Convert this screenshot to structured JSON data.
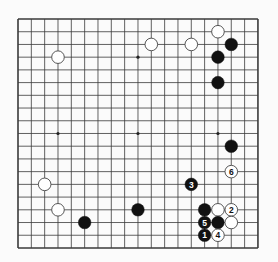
{
  "board": {
    "size": 19,
    "origin_x": 18,
    "origin_y": 19,
    "step_x": 13.33,
    "step_y": 12.72,
    "stone_radius": 6.3,
    "colors": {
      "background": "#fbfbfb",
      "line": "#3a3a3a",
      "black_stone": "#111111",
      "white_stone": "#ffffff",
      "white_outline": "#444444",
      "hoshi": "#222222"
    },
    "hoshi": [
      [
        3,
        3
      ],
      [
        9,
        3
      ],
      [
        15,
        3
      ],
      [
        3,
        9
      ],
      [
        9,
        9
      ],
      [
        15,
        9
      ],
      [
        3,
        15
      ],
      [
        9,
        15
      ],
      [
        15,
        15
      ]
    ],
    "stones": [
      {
        "color": "white",
        "col": 3,
        "row": 3,
        "label": ""
      },
      {
        "color": "white",
        "col": 10,
        "row": 2,
        "label": ""
      },
      {
        "color": "white",
        "col": 13,
        "row": 2,
        "label": ""
      },
      {
        "color": "white",
        "col": 15,
        "row": 1,
        "label": ""
      },
      {
        "color": "black",
        "col": 16,
        "row": 2,
        "label": ""
      },
      {
        "color": "black",
        "col": 15,
        "row": 3,
        "label": ""
      },
      {
        "color": "black",
        "col": 15,
        "row": 5,
        "label": ""
      },
      {
        "color": "black",
        "col": 16,
        "row": 10,
        "label": ""
      },
      {
        "color": "white",
        "col": 16,
        "row": 12,
        "label": "6"
      },
      {
        "color": "black",
        "col": 13,
        "row": 13,
        "label": "3"
      },
      {
        "color": "white",
        "col": 2,
        "row": 13,
        "label": ""
      },
      {
        "color": "white",
        "col": 3,
        "row": 15,
        "label": ""
      },
      {
        "color": "black",
        "col": 5,
        "row": 16,
        "label": ""
      },
      {
        "color": "black",
        "col": 9,
        "row": 15,
        "label": ""
      },
      {
        "color": "black",
        "col": 14,
        "row": 15,
        "label": ""
      },
      {
        "color": "white",
        "col": 15,
        "row": 15,
        "label": ""
      },
      {
        "color": "white",
        "col": 16,
        "row": 15,
        "label": "2"
      },
      {
        "color": "black",
        "col": 14,
        "row": 16,
        "label": "5"
      },
      {
        "color": "black",
        "col": 15,
        "row": 16,
        "label": ""
      },
      {
        "color": "white",
        "col": 16,
        "row": 16,
        "label": ""
      },
      {
        "color": "black",
        "col": 14,
        "row": 17,
        "label": "1"
      },
      {
        "color": "white",
        "col": 15,
        "row": 17,
        "label": "4"
      }
    ]
  }
}
